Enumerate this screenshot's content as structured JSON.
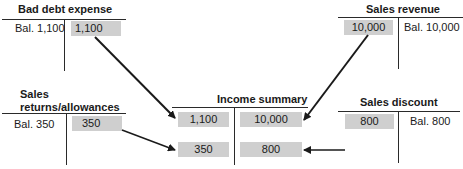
{
  "accounts": {
    "bad_debt_expense": {
      "title": "Bad debt expense",
      "debit_balance": "Bal. 1,100",
      "credit_entry": "1,100"
    },
    "sales_revenue": {
      "title": "Sales revenue",
      "debit_entry": "10,000",
      "credit_balance": "Bal. 10,000"
    },
    "sales_returns_allowances": {
      "title_line1": "Sales",
      "title_line2": "returns/allowances",
      "debit_balance": "Bal. 350",
      "credit_entry": "350"
    },
    "sales_discount": {
      "title": "Sales discount",
      "debit_entry": "800",
      "credit_balance": "Bal. 800"
    },
    "income_summary": {
      "title": "Income summary",
      "debit_entries": [
        "1,100",
        "350"
      ],
      "credit_entries": [
        "10,000",
        "800"
      ]
    }
  },
  "arrows": [
    {
      "from": "bad_debt_expense",
      "to": "income_summary",
      "amount": "1,100"
    },
    {
      "from": "sales_revenue",
      "to": "income_summary",
      "amount": "10,000"
    },
    {
      "from": "sales_returns_allowances",
      "to": "income_summary",
      "amount": "350"
    },
    {
      "from": "sales_discount",
      "to": "income_summary",
      "amount": "800"
    }
  ],
  "colors": {
    "highlight_box": "#cfcfcf",
    "line": "#2a2a2a"
  }
}
